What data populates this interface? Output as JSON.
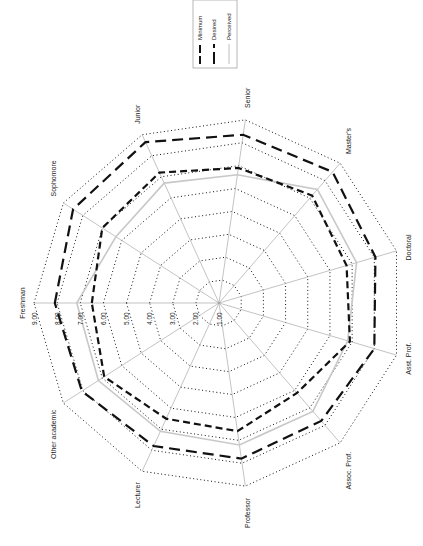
{
  "chart_data": {
    "type": "radar",
    "title": "",
    "orientation": "rotated-90-ccw",
    "categories": [
      "Freshman",
      "Sophomore",
      "Junior",
      "Senior",
      "Master's",
      "Doctoral",
      "Asst. Prof.",
      "Assoc. Prof.",
      "Professor",
      "Lecturer",
      "Other academic"
    ],
    "scale": {
      "min": 1,
      "max": 9,
      "ticks": [
        "1.00",
        "2.00",
        "3.00",
        "4.00",
        "5.00",
        "6.00",
        "7.00",
        "8.00",
        "9.00"
      ]
    },
    "grid": true,
    "legend": {
      "position": "top-right",
      "entries": [
        "Minimum",
        "Desired",
        "Perceived"
      ]
    },
    "series": [
      {
        "name": "Minimum",
        "style": "dashed-black",
        "color": "#111111",
        "values": [
          6.5,
          7.0,
          7.2,
          6.9,
          7.15,
          6.75,
          6.9,
          6.15,
          6.6,
          6.5,
          6.9
        ]
      },
      {
        "name": "Desired",
        "style": "long-dashed-black",
        "color": "#111111",
        "values": [
          8.1,
          8.5,
          8.65,
          8.35,
          8.5,
          8.05,
          8.0,
          7.75,
          7.8,
          7.8,
          8.05
        ]
      },
      {
        "name": "Perceived",
        "style": "solid-gray",
        "color": "#c8c8c8",
        "values": [
          7.15,
          6.3,
          6.7,
          6.6,
          7.5,
          7.2,
          6.8,
          7.2,
          7.2,
          7.1,
          7.2
        ]
      }
    ]
  }
}
